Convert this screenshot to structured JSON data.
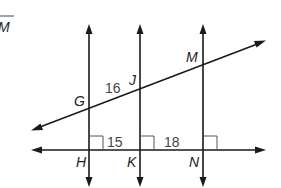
{
  "corner_label": {
    "text": "M",
    "overline": true
  },
  "points": {
    "G": "G",
    "J": "J",
    "M": "M",
    "H": "H",
    "K": "K",
    "N": "N"
  },
  "measures": {
    "GJ": "16",
    "HK": "15",
    "KN": "18"
  },
  "colors": {
    "line": "#1a1a1a",
    "text": "#222222",
    "measure": "#444444",
    "background": "#ffffff"
  }
}
